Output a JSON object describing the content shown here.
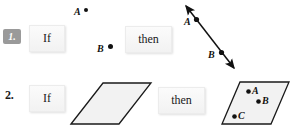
{
  "page": {
    "background": "#ffffff",
    "width": 297,
    "height": 125
  },
  "colors": {
    "badge_bg": "#9a9a9a",
    "badge_text": "#ffffff",
    "chip_bg": "#f5f5f5",
    "chip_text": "#1a1a1a",
    "ink": "#111111",
    "shape_stroke": "#1a1a1a",
    "shape_fill": "#f2f2f2"
  },
  "problems": [
    {
      "number": "1.",
      "number_style": "badge",
      "if_label": "If",
      "then_label": "then",
      "given": {
        "type": "two-points",
        "points": [
          {
            "label": "A",
            "x": 88,
            "y": 11
          },
          {
            "label": "B",
            "x": 111,
            "y": 47
          }
        ]
      },
      "conclusion": {
        "type": "line-through-points",
        "arrow_both_ends": true,
        "points": [
          {
            "label": "A",
            "x": 196,
            "y": 19
          },
          {
            "label": "B",
            "x": 222,
            "y": 54
          }
        ]
      }
    },
    {
      "number": "2.",
      "number_style": "plain",
      "if_label": "If",
      "then_label": "then",
      "given": {
        "type": "plane",
        "shape": "parallelogram",
        "points": []
      },
      "conclusion": {
        "type": "plane-with-points",
        "shape": "parallelogram",
        "points": [
          {
            "label": "A",
            "x": 250,
            "y": 93
          },
          {
            "label": "B",
            "x": 260,
            "y": 103
          },
          {
            "label": "C",
            "x": 235,
            "y": 117
          }
        ]
      }
    }
  ],
  "row1": {
    "badge_text": "1.",
    "if_text": "If",
    "then_text": "then",
    "point_a_label": "A",
    "point_b_label": "B",
    "line_point_a_label": "A",
    "line_point_b_label": "B"
  },
  "row2": {
    "number_text": "2.",
    "if_text": "If",
    "then_text": "then",
    "plane_point_a_label": "A",
    "plane_point_b_label": "B",
    "plane_point_c_label": "C"
  }
}
